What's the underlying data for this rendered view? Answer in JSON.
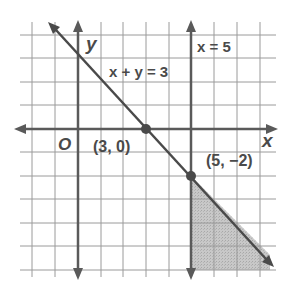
{
  "graph": {
    "axes": {
      "x_label": "x",
      "y_label": "y",
      "origin_label": "O"
    },
    "lines": [
      {
        "equation": "x + y = 3",
        "label": "x + y = 3",
        "style": "solid"
      },
      {
        "equation": "x = 5",
        "label": "x = 5",
        "style": "solid"
      }
    ],
    "points": [
      {
        "label": "(3, 0)",
        "x": 3,
        "y": 0
      },
      {
        "label": "(5, −2)",
        "x": 5,
        "y": -2
      }
    ],
    "shaded_region": "x ≥ 5 and x + y ≤ 3",
    "grid": {
      "x_range": [
        -2,
        8
      ],
      "y_range": [
        -6,
        4
      ],
      "step": 1
    },
    "colors": {
      "grid": "#9a9a9a",
      "axis": "#5a5a5a",
      "line": "#4a4a4a",
      "shade": "#c4c4c4",
      "text": "#4a4a4a"
    }
  }
}
